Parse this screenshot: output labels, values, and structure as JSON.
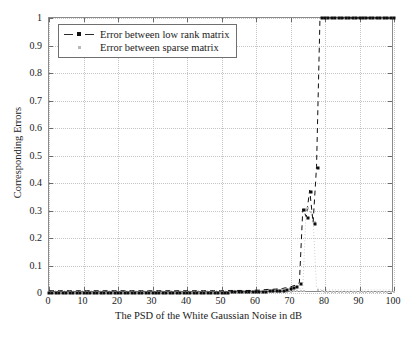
{
  "chart_data": {
    "type": "line",
    "title": "",
    "xlabel": "The PSD of the White Gaussian Noise in dB",
    "ylabel": "Corresponding Errors",
    "xlim": [
      0,
      100
    ],
    "ylim": [
      0,
      1
    ],
    "xticks": [
      0,
      10,
      20,
      30,
      40,
      50,
      60,
      70,
      80,
      90,
      100
    ],
    "xticklabels": [
      "0",
      "10",
      "20",
      "30",
      "40",
      "50",
      "60",
      "70",
      "80",
      "90",
      "100"
    ],
    "yticks": [
      0,
      0.1,
      0.2,
      0.3,
      0.4,
      0.5,
      0.6,
      0.7,
      0.8,
      0.9,
      1
    ],
    "yticklabels": [
      "0",
      "0.1",
      "0.2",
      "0.3",
      "0.4",
      "0.5",
      "0.6",
      "0.7",
      "0.8",
      "0.9",
      "1"
    ],
    "grid": true,
    "grid_style": "dotted",
    "legend_position": "upper-left",
    "legend": [
      "Error between low rank matrix",
      "Error between sparse matrix"
    ],
    "colors": {
      "low_rank": "#0d0d0d",
      "sparse": "#c2c2c2",
      "grid": "#c4c4c4",
      "axis": "#8a8a8a",
      "background": "#ffffff"
    },
    "series": [
      {
        "name": "Error between low rank matrix",
        "marker": "square",
        "linestyle": "dashed",
        "color": "#0d0d0d",
        "x": [
          0,
          1,
          2,
          3,
          4,
          5,
          6,
          7,
          8,
          9,
          10,
          11,
          12,
          13,
          14,
          15,
          16,
          17,
          18,
          19,
          20,
          21,
          22,
          23,
          24,
          25,
          26,
          27,
          28,
          29,
          30,
          31,
          32,
          33,
          34,
          35,
          36,
          37,
          38,
          39,
          40,
          41,
          42,
          43,
          44,
          45,
          46,
          47,
          48,
          49,
          50,
          51,
          52,
          53,
          54,
          55,
          56,
          57,
          58,
          59,
          60,
          61,
          62,
          63,
          64,
          65,
          66,
          67,
          68,
          69,
          70,
          71,
          72,
          73,
          74,
          75,
          76,
          77,
          78,
          79,
          80,
          81,
          82,
          83,
          84,
          85,
          86,
          87,
          88,
          89,
          90,
          91,
          92,
          93,
          94,
          95,
          96,
          97,
          98,
          99,
          100
        ],
        "y": [
          0.001,
          0.001,
          0.001,
          0.001,
          0.001,
          0.001,
          0.001,
          0.001,
          0.001,
          0.001,
          0.001,
          0.001,
          0.001,
          0.001,
          0.001,
          0.001,
          0.001,
          0.001,
          0.001,
          0.001,
          0.001,
          0.001,
          0.001,
          0.001,
          0.001,
          0.001,
          0.001,
          0.001,
          0.001,
          0.001,
          0.001,
          0.001,
          0.001,
          0.001,
          0.001,
          0.001,
          0.001,
          0.001,
          0.001,
          0.001,
          0.001,
          0.001,
          0.001,
          0.001,
          0.001,
          0.001,
          0.001,
          0.001,
          0.001,
          0.001,
          0.001,
          0.001,
          0.001,
          0.002,
          0.002,
          0.002,
          0.002,
          0.002,
          0.002,
          0.002,
          0.003,
          0.003,
          0.004,
          0.005,
          0.006,
          0.006,
          0.007,
          0.008,
          0.009,
          0.012,
          0.013,
          0.018,
          0.022,
          0.031,
          0.301,
          0.272,
          0.369,
          0.251,
          0.456,
          1.0,
          1.0,
          1.0,
          1.0,
          1.0,
          1.0,
          1.0,
          1.0,
          1.0,
          1.0,
          1.0,
          1.0,
          1.0,
          1.0,
          1.0,
          1.0,
          1.0,
          1.0,
          1.0,
          1.0,
          1.0,
          1.0
        ]
      },
      {
        "name": "Error between sparse matrix",
        "marker": "dot",
        "linestyle": "dotted",
        "color": "#c2c2c2",
        "x": [
          0,
          1,
          2,
          3,
          4,
          5,
          6,
          7,
          8,
          9,
          10,
          11,
          12,
          13,
          14,
          15,
          16,
          17,
          18,
          19,
          20,
          21,
          22,
          23,
          24,
          25,
          26,
          27,
          28,
          29,
          30,
          31,
          32,
          33,
          34,
          35,
          36,
          37,
          38,
          39,
          40,
          41,
          42,
          43,
          44,
          45,
          46,
          47,
          48,
          49,
          50,
          51,
          52,
          53,
          54,
          55,
          56,
          57,
          58,
          59,
          60,
          61,
          62,
          63,
          64,
          65,
          66,
          67,
          68,
          69,
          70,
          71,
          72,
          73,
          74,
          75,
          76,
          77,
          78,
          79,
          80,
          81,
          82,
          83,
          84,
          85,
          86,
          87,
          88,
          89,
          90,
          91,
          92,
          93,
          94,
          95,
          96,
          97,
          98,
          99,
          100
        ],
        "y": [
          0.002,
          0.002,
          0.002,
          0.002,
          0.002,
          0.002,
          0.002,
          0.002,
          0.002,
          0.002,
          0.002,
          0.002,
          0.002,
          0.002,
          0.002,
          0.002,
          0.002,
          0.002,
          0.002,
          0.002,
          0.002,
          0.002,
          0.002,
          0.002,
          0.002,
          0.002,
          0.002,
          0.002,
          0.002,
          0.002,
          0.002,
          0.002,
          0.002,
          0.002,
          0.002,
          0.002,
          0.002,
          0.002,
          0.002,
          0.002,
          0.002,
          0.002,
          0.002,
          0.002,
          0.002,
          0.002,
          0.002,
          0.002,
          0.002,
          0.002,
          0.002,
          0.002,
          0.002,
          0.002,
          0.002,
          0.002,
          0.002,
          0.002,
          0.002,
          0.002,
          0.002,
          0.002,
          0.003,
          0.003,
          0.003,
          0.003,
          0.004,
          0.004,
          0.004,
          0.005,
          0.005,
          0.006,
          0.007,
          0.008,
          0.009,
          0.31,
          0.295,
          0.26,
          0.012,
          0.006,
          0.004,
          0.004,
          0.004,
          0.004,
          0.004,
          0.004,
          0.004,
          0.004,
          0.004,
          0.004,
          0.004,
          0.004,
          0.004,
          0.004,
          0.004,
          0.004,
          0.004,
          0.004,
          0.004,
          0.004,
          0.004
        ]
      }
    ]
  }
}
